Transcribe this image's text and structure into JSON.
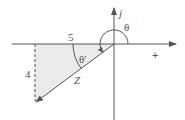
{
  "diagram": {
    "type": "complex-plane-phasor",
    "colors": {
      "line": "#555555",
      "fill": "#ebebeb",
      "background": "#ffffff"
    },
    "axes": {
      "imaginary_label": "j",
      "positive_real_label": "+"
    },
    "triangle": {
      "horizontal_side_label": "5",
      "vertical_side_label": "4",
      "hypotenuse_label": "Z"
    },
    "angles": {
      "theta_label": "θ",
      "theta_prime_label": "θ′"
    }
  }
}
